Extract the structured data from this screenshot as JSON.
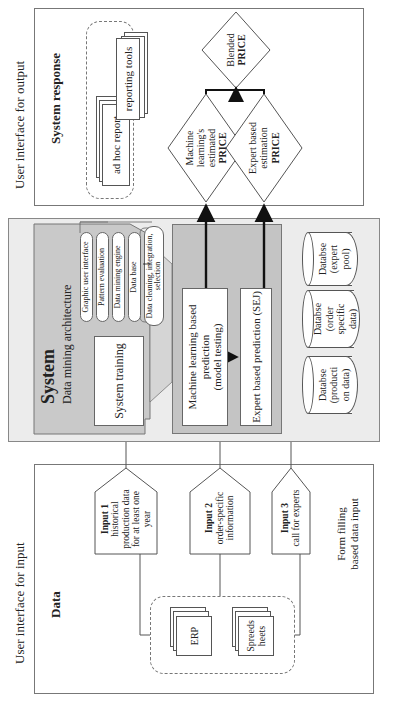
{
  "diagram": {
    "orientation": "rotated 90 degrees counter-clockwise",
    "sections": {
      "input": {
        "header": "User interface for input",
        "title": "Data",
        "form_label_1": "Form filling",
        "form_label_2": "based data input",
        "sources": [
          {
            "label": "ERP"
          },
          {
            "label_1": "Spreeds",
            "label_2": "heets"
          }
        ],
        "inputs": [
          {
            "title": "Input 1",
            "lines": [
              "historical",
              "production data",
              "for at least one",
              "year"
            ]
          },
          {
            "title": "Input 2",
            "lines": [
              "order-specific",
              "information"
            ]
          },
          {
            "title": "Input 3",
            "lines": [
              "call for experts"
            ]
          }
        ]
      },
      "backend": {
        "header": "Back end",
        "system_title": "System",
        "architecture_title": "Data mining architecture",
        "system_training": "System training",
        "architecture_layers": [
          "Graphic user interface",
          "Pattern evaluation",
          "Data mining engine",
          "Data base",
          "Data cleaning, integration,",
          "selection"
        ],
        "ml_prediction": [
          "Machine learning based",
          "prediction",
          "(model testing)"
        ],
        "expert_prediction": "Expert based prediction (SEJ)",
        "databases": [
          {
            "lines": [
              "Databse",
              "(producti",
              "on data)"
            ]
          },
          {
            "lines": [
              "Databse",
              "(order",
              "specific",
              "data)"
            ]
          },
          {
            "lines": [
              "Databse",
              "(expert",
              "pool)"
            ]
          }
        ]
      },
      "output": {
        "header": "User interface for output",
        "title": "System response",
        "reports": [
          "ad hoc report",
          "reporting tools"
        ],
        "ml_price": {
          "lines": [
            "Machine",
            "learning's",
            "estimated"
          ],
          "bold": "PRICE"
        },
        "expert_price": {
          "lines": [
            "Expert based",
            "estimation"
          ],
          "bold": "PRICE"
        },
        "blended_price": {
          "lines": [
            "Blended"
          ],
          "bold": "PRICE"
        }
      }
    },
    "colors": {
      "backend_bg": "#ececec",
      "system_bg": "#c9c9c9",
      "arrow": "#111111",
      "border": "#777777"
    }
  }
}
